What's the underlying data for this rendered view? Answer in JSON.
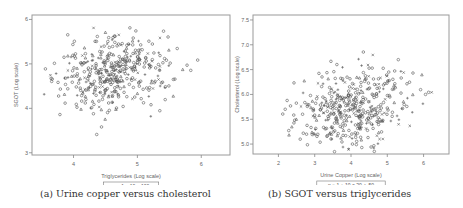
{
  "figure": {
    "captions": [
      "(a) Urine copper versus cholesterol",
      "(b) SGOT versus triglycerides"
    ]
  },
  "chart_data": [
    {
      "type": "scatter",
      "title": "",
      "xlabel": "Triglycerides (Log scale)",
      "ylabel": "SGOT (Log scale)",
      "xlim": [
        3.35,
        6.45
      ],
      "ylim": [
        2.95,
        6.1
      ],
      "x_ticks": [
        4,
        5,
        6
      ],
      "y_ticks": [
        3,
        4,
        5,
        6
      ],
      "grid": false,
      "legend": {
        "position": "bottom",
        "entries": [
          "n",
          "○ 1",
          "+ 10",
          "× 100"
        ]
      },
      "frame": {
        "x0": 32,
        "y0": 15,
        "x1": 230,
        "y1": 155
      },
      "cluster": {
        "cx": 4.65,
        "cy": 4.8,
        "sx": 0.42,
        "sy": 0.42,
        "n": 420,
        "seed": 7
      }
    },
    {
      "type": "scatter",
      "title": "",
      "xlabel": "Urine Copper (Log scale)",
      "ylabel": "Cholesterol (Log scale)",
      "xlim": [
        1.3,
        6.7
      ],
      "ylim": [
        4.8,
        7.6
      ],
      "x_ticks": [
        2,
        3,
        4,
        5,
        6
      ],
      "y_ticks": [
        5.0,
        5.5,
        6.0,
        6.5,
        7.0,
        7.5
      ],
      "grid": false,
      "legend": {
        "position": "bottom",
        "entries": [
          "n",
          "○ 1",
          "+ 10",
          "× 20",
          "△ 50"
        ]
      },
      "frame": {
        "x0": 253,
        "y0": 15,
        "x1": 449,
        "y1": 154
      },
      "cluster": {
        "cx": 4.1,
        "cy": 5.75,
        "sx": 0.8,
        "sy": 0.42,
        "n": 430,
        "seed": 13
      }
    }
  ]
}
